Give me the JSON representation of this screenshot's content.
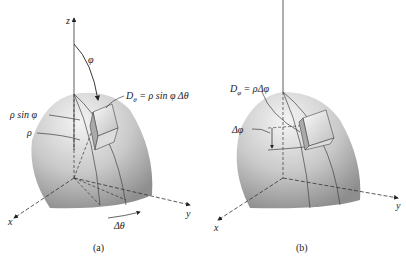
{
  "panels": [
    {
      "id": "a",
      "caption": "(a)",
      "labels": {
        "z_axis": "z",
        "x_axis": "x",
        "y_axis": "y",
        "phi": "φ",
        "rho_sin_phi": "ρ sin φ",
        "rho": "ρ",
        "D_theta_eq": "D",
        "D_theta_sub": "θ",
        "D_theta_rhs": " = ρ sin φ Δθ",
        "delta_theta": "Δθ"
      }
    },
    {
      "id": "b",
      "caption": "(b)",
      "labels": {
        "x_axis": "x",
        "y_axis": "y",
        "D_phi_eq": "D",
        "D_phi_sub": "φ",
        "D_phi_rhs": " = ρΔφ",
        "delta_phi": "Δφ"
      }
    }
  ],
  "colors": {
    "surface_light": "#f2f2f2",
    "surface_dark": "#9a9a9a",
    "line": "#333333"
  }
}
